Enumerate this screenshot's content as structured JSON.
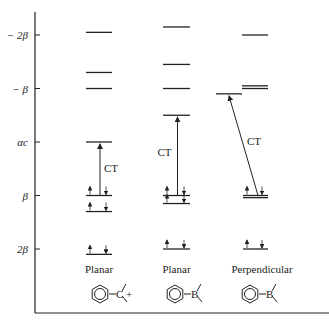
{
  "title": "",
  "axis": {
    "ticks": [
      {
        "label": "− 2β",
        "energy": -2
      },
      {
        "label": "− β",
        "energy": -1
      },
      {
        "label": "αc",
        "energy": 0
      },
      {
        "label": "β",
        "energy": 1
      },
      {
        "label": "2β",
        "energy": 2
      }
    ]
  },
  "columns": [
    {
      "caption": "Planar",
      "molecule": "Ph–C+",
      "atom": "C",
      "charge": "+",
      "levels_energy": [
        -2.05,
        -1.3,
        -1.0,
        0.0,
        1.0,
        1.3,
        2.1
      ],
      "occupied_from_index": 4,
      "ct_label": "CT",
      "ct_from": 1.0,
      "ct_to": 0.0
    },
    {
      "caption": "Planar",
      "molecule": "Ph–BR2",
      "atom": "B",
      "charge": "",
      "levels_energy": [
        -2.15,
        -1.45,
        -1.0,
        -0.5,
        1.0,
        1.15,
        2.0
      ],
      "occupied_from_index": 4,
      "ct_label": "CT",
      "ct_from": 1.0,
      "ct_to": -0.5
    },
    {
      "caption": "Perpendicular",
      "molecule": "Ph–BR2",
      "atom": "B",
      "charge": "",
      "levels_energy": [
        -2.0,
        -1.05,
        -1.0,
        -0.9,
        1.0,
        1.04,
        2.0
      ],
      "occupied_from_index": 4,
      "ct_label": "CT",
      "ct_from": 1.0,
      "ct_to": -0.9
    }
  ]
}
